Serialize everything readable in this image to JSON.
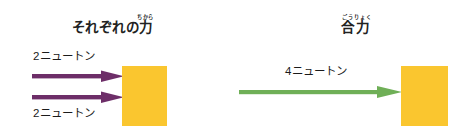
{
  "figure": {
    "background_color": "#ffffff",
    "width": 475,
    "height": 134
  },
  "panels": {
    "left": {
      "title_base": "それぞれの力",
      "title_body": "それぞれの",
      "title_kanji": "力",
      "title_ruby": "ちから",
      "forces": [
        {
          "label": "2ニュートン",
          "value": 2,
          "unit": "ニュートン",
          "color": "#6d2e68",
          "direction": "right"
        },
        {
          "label": "2ニュートン",
          "value": 2,
          "unit": "ニュートン",
          "color": "#6d2e68",
          "direction": "right"
        }
      ],
      "block": {
        "name": "block",
        "color": "#fac62f"
      }
    },
    "right": {
      "title_base": "合力",
      "title_kanji": "合",
      "title_kanji_2": "力",
      "title_ruby": "ごうりょく",
      "title_ruby_1": "ごう",
      "title_ruby_2": "りょく",
      "forces": [
        {
          "label": "4ニュートン",
          "value": 4,
          "unit": "ニュートン",
          "color": "#6faf57",
          "direction": "right"
        }
      ],
      "block": {
        "name": "block",
        "color": "#fac62f"
      }
    }
  },
  "colors": {
    "force_purple": "#6d2e68",
    "force_green": "#6faf57",
    "block_yellow": "#fac62f",
    "text": "#1b1b1b",
    "background": "#ffffff"
  }
}
